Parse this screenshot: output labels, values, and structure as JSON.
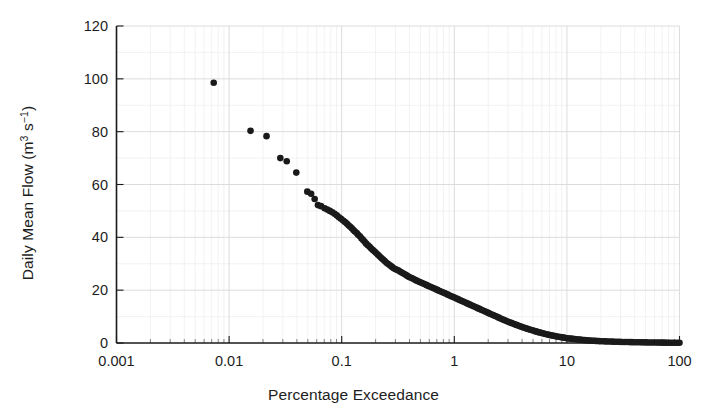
{
  "chart_data": {
    "type": "scatter",
    "title": "",
    "xlabel": "Percentage Exceedance",
    "ylabel": "Daily Mean Flow (m3 s-1)",
    "ylabel_parts": {
      "prefix": "Daily Mean Flow (m",
      "sup1": "3",
      "mid": " s",
      "sup2": "−1",
      "suffix": ")"
    },
    "xscale": "log",
    "yscale": "linear",
    "xlim": [
      0.001,
      100
    ],
    "ylim": [
      0,
      120
    ],
    "xticks": [
      "0.001",
      "0.01",
      "0.1",
      "1",
      "10",
      "100"
    ],
    "xtick_values": [
      0.001,
      0.01,
      0.1,
      1,
      10,
      100
    ],
    "yticks": [
      "0",
      "20",
      "40",
      "60",
      "80",
      "100",
      "120"
    ],
    "ytick_values": [
      0,
      20,
      40,
      60,
      80,
      100,
      120
    ],
    "grid": "major-and-minor",
    "grid_color": "#d8d8d8",
    "minor_grid_color": "#ededed",
    "legend": "none",
    "marker": {
      "shape": "circle",
      "color": "#1a1a1a",
      "size": 4.6
    },
    "series": [
      {
        "name": "Flow Duration Curve",
        "x": [
          0.0073,
          0.0155,
          0.0215,
          0.0285,
          0.0325,
          0.0395,
          0.0495,
          0.0535,
          0.0575,
          0.0615,
          0.0655,
          0.0705,
          0.0745,
          0.0785,
          0.0825,
          0.0865,
          0.0905,
          0.0945,
          0.0985,
          0.103,
          0.107,
          0.111,
          0.115,
          0.119,
          0.123,
          0.127,
          0.131,
          0.136,
          0.14,
          0.145,
          0.15,
          0.155,
          0.16,
          0.165,
          0.171,
          0.177,
          0.183,
          0.189,
          0.196,
          0.203,
          0.21,
          0.217,
          0.225,
          0.233,
          0.241,
          0.25,
          0.259,
          0.268,
          0.278,
          0.288,
          0.298,
          0.309,
          0.32,
          0.332,
          0.344,
          0.357,
          0.37,
          0.383,
          0.397,
          0.412,
          0.427,
          0.443,
          0.459,
          0.476,
          0.493,
          0.511,
          0.53,
          0.549,
          0.569,
          0.59,
          0.612,
          0.634,
          0.657,
          0.681,
          0.706,
          0.732,
          0.759,
          0.787,
          0.816,
          0.846,
          0.877,
          0.909,
          0.942,
          0.977,
          1.013,
          1.05,
          1.088,
          1.128,
          1.169,
          1.212,
          1.256,
          1.302,
          1.35,
          1.399,
          1.45,
          1.503,
          1.558,
          1.615,
          1.674,
          1.735,
          1.798,
          1.864,
          1.932,
          2.003,
          2.076,
          2.152,
          2.231,
          2.312,
          2.397,
          2.485,
          2.576,
          2.67,
          2.768,
          2.869,
          2.974,
          3.083,
          3.196,
          3.313,
          3.434,
          3.56,
          3.69,
          3.825,
          3.965,
          4.11,
          4.261,
          4.417,
          4.579,
          4.746,
          4.92,
          5.1,
          5.287,
          5.48,
          5.681,
          5.889,
          6.104,
          6.328,
          6.56,
          6.8,
          7.049,
          7.307,
          7.575,
          7.852,
          8.139,
          8.437,
          8.746,
          9.066,
          9.398,
          9.742,
          10.1,
          10.47,
          10.85,
          11.25,
          11.66,
          12.09,
          12.53,
          12.99,
          13.47,
          13.96,
          14.47,
          15.0,
          15.55,
          16.12,
          16.71,
          17.32,
          17.95,
          18.61,
          19.29,
          20.0,
          21.0,
          22.05,
          23.15,
          24.31,
          25.53,
          26.8,
          28.14,
          29.55,
          31.03,
          32.58,
          34.21,
          35.92,
          37.72,
          39.6,
          41.58,
          43.66,
          45.85,
          48.14,
          50.55,
          53.07,
          55.73,
          58.51,
          61.44,
          64.51,
          67.74,
          71.12,
          74.68,
          78.41,
          82.33,
          86.45,
          90.77,
          95.31,
          100.0
        ],
        "y": [
          98.5,
          80.3,
          78.3,
          70.0,
          68.8,
          64.5,
          57.3,
          56.5,
          54.5,
          52.2,
          51.8,
          51.0,
          50.5,
          50.0,
          49.5,
          48.9,
          48.3,
          47.6,
          47.0,
          46.4,
          45.8,
          45.2,
          44.6,
          44.0,
          43.4,
          42.8,
          42.2,
          41.6,
          41.0,
          40.4,
          39.6,
          39.0,
          38.3,
          37.6,
          37.0,
          36.4,
          35.8,
          35.2,
          34.6,
          34.0,
          33.4,
          32.8,
          32.2,
          31.6,
          31.0,
          30.4,
          29.9,
          29.4,
          28.9,
          28.4,
          28.0,
          27.7,
          27.4,
          27.0,
          26.6,
          26.2,
          25.8,
          25.4,
          25.0,
          24.7,
          24.4,
          24.0,
          23.7,
          23.4,
          23.1,
          22.8,
          22.5,
          22.2,
          21.9,
          21.6,
          21.3,
          21.0,
          20.7,
          20.4,
          20.1,
          19.8,
          19.5,
          19.2,
          18.9,
          18.6,
          18.3,
          18.0,
          17.7,
          17.4,
          17.1,
          16.8,
          16.5,
          16.2,
          15.9,
          15.6,
          15.3,
          15.0,
          14.7,
          14.4,
          14.1,
          13.8,
          13.5,
          13.2,
          12.9,
          12.6,
          12.3,
          12.0,
          11.7,
          11.4,
          11.1,
          10.8,
          10.5,
          10.2,
          9.9,
          9.6,
          9.3,
          9.0,
          8.7,
          8.42,
          8.15,
          7.88,
          7.62,
          7.36,
          7.1,
          6.85,
          6.6,
          6.36,
          6.12,
          5.89,
          5.66,
          5.44,
          5.22,
          5.01,
          4.8,
          4.6,
          4.4,
          4.21,
          4.02,
          3.84,
          3.67,
          3.5,
          3.34,
          3.18,
          3.03,
          2.88,
          2.74,
          2.61,
          2.48,
          2.36,
          2.24,
          2.13,
          2.02,
          1.92,
          1.82,
          1.73,
          1.64,
          1.56,
          1.48,
          1.4,
          1.33,
          1.26,
          1.2,
          1.14,
          1.08,
          1.02,
          0.97,
          0.92,
          0.87,
          0.83,
          0.79,
          0.75,
          0.71,
          0.68,
          0.64,
          0.6,
          0.57,
          0.54,
          0.51,
          0.48,
          0.45,
          0.43,
          0.4,
          0.38,
          0.36,
          0.34,
          0.32,
          0.3,
          0.28,
          0.27,
          0.25,
          0.24,
          0.22,
          0.21,
          0.2,
          0.19,
          0.17,
          0.16,
          0.15,
          0.14,
          0.13,
          0.12,
          0.11,
          0.1,
          0.09,
          0.08,
          0.07
        ]
      }
    ]
  },
  "figure": {
    "background": "#ffffff",
    "axis_color": "#1a1a1a"
  }
}
